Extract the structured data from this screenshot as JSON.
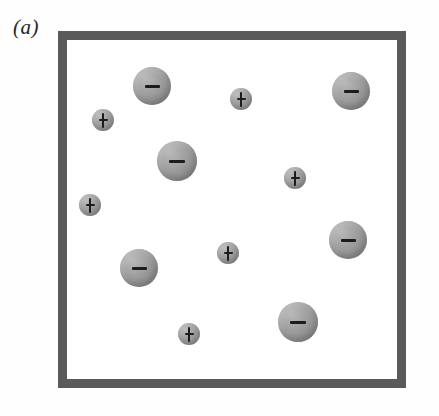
{
  "figure": {
    "panel_label": "(a)",
    "type": "particle-diagram",
    "description_alt": "Square container holding large negatively charged spheres and small positively charged spheres",
    "colors": {
      "border": "#5a5a5a",
      "background": "#ffffff",
      "sphere_mid_gray": "#9a9a9a",
      "sphere_highlight": "#bcbcbc",
      "sphere_shadow": "#7d7d7d",
      "glyph": "#1c1c1c",
      "label_text": "#262626"
    },
    "container": {
      "left": 58,
      "top": 31,
      "width": 348,
      "height": 357,
      "border_width": 9
    },
    "counts": {
      "negative": 7,
      "positive": 6,
      "total": 13
    },
    "particles": [
      {
        "id": "neg-1",
        "charge": "−",
        "kind": "negative",
        "cx": 152,
        "cy": 86,
        "r": 19
      },
      {
        "id": "neg-2",
        "charge": "−",
        "kind": "negative",
        "cx": 351,
        "cy": 91,
        "r": 19
      },
      {
        "id": "neg-3",
        "charge": "−",
        "kind": "negative",
        "cx": 177,
        "cy": 161,
        "r": 20
      },
      {
        "id": "neg-4",
        "charge": "−",
        "kind": "negative",
        "cx": 348,
        "cy": 240,
        "r": 19
      },
      {
        "id": "neg-5",
        "charge": "−",
        "kind": "negative",
        "cx": 139,
        "cy": 268,
        "r": 19
      },
      {
        "id": "neg-6",
        "charge": "−",
        "kind": "negative",
        "cx": 298,
        "cy": 322,
        "r": 20
      },
      {
        "id": "pos-1",
        "charge": "+",
        "kind": "positive",
        "cx": 103,
        "cy": 120,
        "r": 11
      },
      {
        "id": "pos-2",
        "charge": "+",
        "kind": "positive",
        "cx": 241,
        "cy": 99,
        "r": 11
      },
      {
        "id": "pos-3",
        "charge": "+",
        "kind": "positive",
        "cx": 295,
        "cy": 178,
        "r": 11
      },
      {
        "id": "pos-4",
        "charge": "+",
        "kind": "positive",
        "cx": 90,
        "cy": 205,
        "r": 11
      },
      {
        "id": "pos-5",
        "charge": "+",
        "kind": "positive",
        "cx": 228,
        "cy": 253,
        "r": 11
      },
      {
        "id": "pos-6",
        "charge": "+",
        "kind": "positive",
        "cx": 189,
        "cy": 334,
        "r": 11
      }
    ]
  }
}
